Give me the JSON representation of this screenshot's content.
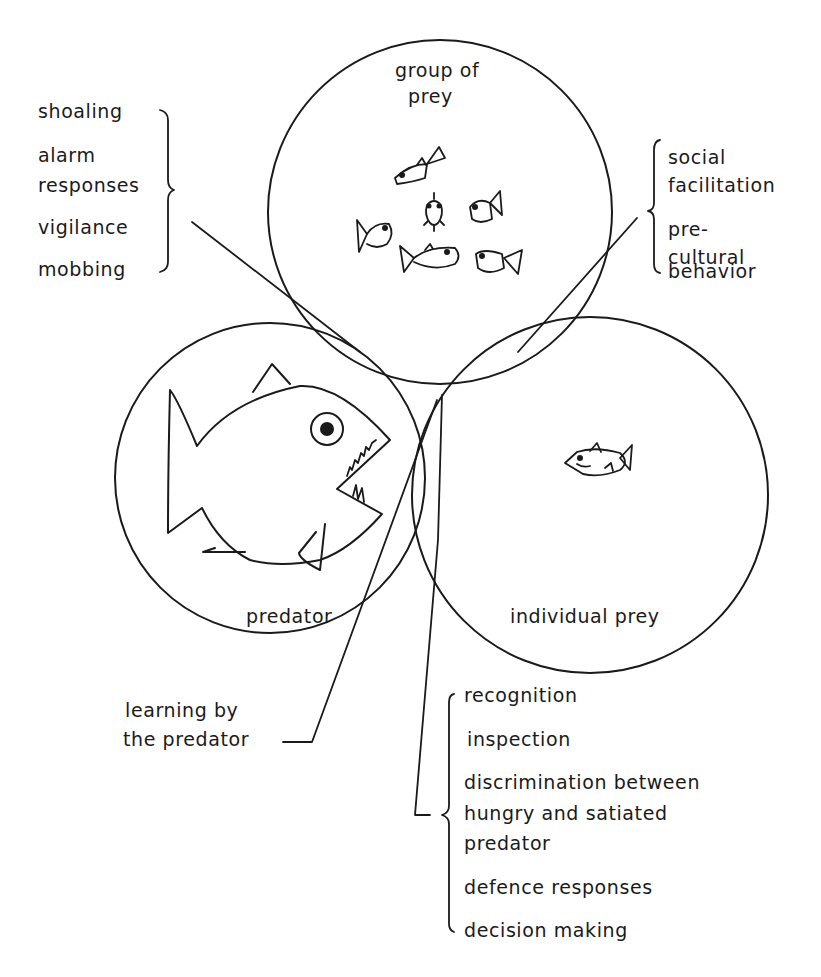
{
  "diagram": {
    "type": "venn",
    "sets": [
      {
        "id": "group",
        "label_lines": [
          "group of",
          "prey"
        ]
      },
      {
        "id": "predator",
        "label_lines": [
          "predator"
        ]
      },
      {
        "id": "individual",
        "label_lines": [
          "individual prey"
        ]
      }
    ],
    "annotations": {
      "group_predator": {
        "items": [
          "shoaling",
          "alarm",
          "responses",
          "vigilance",
          "mobbing"
        ]
      },
      "group_individual": {
        "items": [
          "social",
          "facilitation",
          "pre-",
          "cultural",
          "behavior"
        ]
      },
      "predator_learning": {
        "items": [
          "learning by",
          "the predator"
        ]
      },
      "predator_individual": {
        "items": [
          "recognition",
          "inspection",
          "discrimination between",
          "hungry and satiated",
          "predator",
          "defence responses",
          "decision making"
        ]
      }
    },
    "icons": {
      "predator": "predator-fish-icon",
      "individual": "prey-fish-icon",
      "group": "school-of-fish-icon"
    },
    "colors": {
      "ink": "#1a1a1a",
      "background": "#ffffff"
    }
  }
}
